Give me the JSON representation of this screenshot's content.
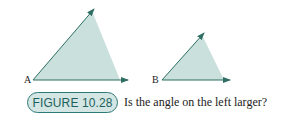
{
  "figure": {
    "label": "FIGURE 10.28",
    "caption": "Is the angle on the left larger?",
    "angles": [
      {
        "vertex_label": "A"
      },
      {
        "vertex_label": "B"
      }
    ],
    "colors": {
      "fill": "#c9e0dc",
      "stroke": "#2f6f63",
      "badge_fill": "#d3e6e3",
      "badge_border": "#2f7a78",
      "badge_text": "#1f5f5d"
    }
  }
}
